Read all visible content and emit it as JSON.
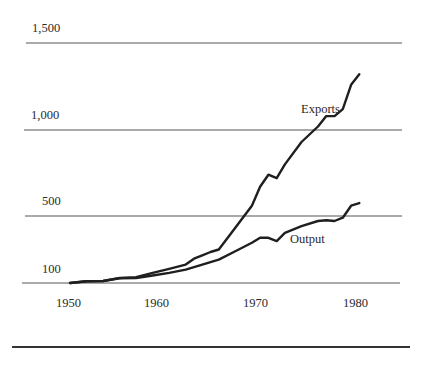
{
  "chart_data": {
    "type": "line",
    "title": "",
    "xlabel": "",
    "ylabel": "",
    "xlim": [
      1950,
      1985
    ],
    "ylim": [
      100,
      1500
    ],
    "grid": true,
    "legend_position": "inline-labels",
    "y_ticks": [
      "1,500",
      "1,000",
      "500",
      "100"
    ],
    "y_tick_values": [
      1500,
      1000,
      500,
      100
    ],
    "x_ticks": [
      "1950",
      "1960",
      "1970",
      "1980"
    ],
    "x_tick_values": [
      1950,
      1960,
      1970,
      1980
    ],
    "x": [
      1950,
      1952,
      1954,
      1956,
      1958,
      1960,
      1962,
      1964,
      1965,
      1966,
      1967,
      1968,
      1970,
      1972,
      1973,
      1974,
      1975,
      1976,
      1978,
      1980,
      1981,
      1982,
      1983,
      1984,
      1985
    ],
    "series": [
      {
        "name": "Exports",
        "values": [
          100,
          110,
          112,
          130,
          135,
          160,
          185,
          210,
          245,
          265,
          285,
          300,
          430,
          560,
          670,
          740,
          720,
          800,
          930,
          1020,
          1080,
          1080,
          1120,
          1260,
          1320
        ]
      },
      {
        "name": "Output",
        "values": [
          100,
          110,
          112,
          128,
          130,
          145,
          160,
          180,
          195,
          210,
          225,
          240,
          290,
          340,
          370,
          370,
          350,
          400,
          440,
          470,
          475,
          470,
          490,
          560,
          575
        ]
      }
    ],
    "annotations": [
      {
        "text": "Exports",
        "x": 1976,
        "y": 1090
      },
      {
        "text": "Output",
        "x": 1977,
        "y": 410
      }
    ]
  },
  "labels": {
    "y_1500": "1,500",
    "y_1000": "1,000",
    "y_500": "500",
    "y_100": "100",
    "x_1950": "1950",
    "x_1960": "1960",
    "x_1970": "1970",
    "x_1980": "1980",
    "series_exports": "Exports",
    "series_output": "Output"
  },
  "colors": {
    "line": "#1f1f1f",
    "grid": "#555555",
    "text": "#2a2a2a"
  }
}
